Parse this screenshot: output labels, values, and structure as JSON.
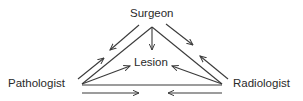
{
  "diagram": {
    "nodes": {
      "surgeon": "Surgeon",
      "lesion": "Lesion",
      "pathologist": "Pathologist",
      "radiologist": "Radiologist"
    },
    "edges": [
      {
        "from": "Surgeon",
        "to": "Pathologist",
        "type": "triangle-side"
      },
      {
        "from": "Surgeon",
        "to": "Radiologist",
        "type": "triangle-side"
      },
      {
        "from": "Pathologist",
        "to": "Radiologist",
        "type": "triangle-base"
      },
      {
        "from": "Surgeon",
        "to": "Lesion",
        "type": "arrow"
      },
      {
        "from": "Pathologist",
        "to": "Lesion",
        "type": "arrow"
      },
      {
        "from": "Radiologist",
        "to": "Lesion",
        "type": "arrow"
      },
      {
        "from": "Surgeon",
        "to": "Pathologist",
        "type": "communication-arrow"
      },
      {
        "from": "Pathologist",
        "to": "Surgeon",
        "type": "communication-arrow"
      },
      {
        "from": "Surgeon",
        "to": "Radiologist",
        "type": "communication-arrow"
      },
      {
        "from": "Radiologist",
        "to": "Surgeon",
        "type": "communication-arrow"
      },
      {
        "from": "Pathologist",
        "to": "Radiologist",
        "type": "communication-arrow"
      },
      {
        "from": "Radiologist",
        "to": "Pathologist",
        "type": "communication-arrow"
      }
    ],
    "colors": {
      "line": "#3a3a3a",
      "text": "#2a2a2a",
      "background": "#ffffff"
    }
  }
}
